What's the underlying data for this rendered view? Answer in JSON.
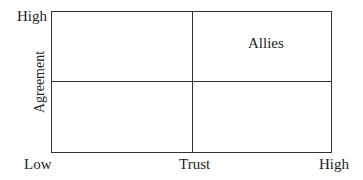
{
  "diagram": {
    "type": "quadrant",
    "x_axis": {
      "label": "Trust",
      "low": "Low",
      "high": "High"
    },
    "y_axis": {
      "label": "Agreement",
      "high": "High"
    },
    "quadrants": [
      {
        "position": "top-right",
        "label": "Allies"
      }
    ]
  }
}
